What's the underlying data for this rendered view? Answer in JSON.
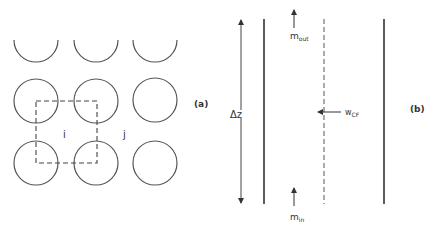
{
  "panel_a": {
    "label": "(a)",
    "cell_labels": {
      "i": "i",
      "j": "j"
    },
    "rod_grid": {
      "rows": 3,
      "cols": 3,
      "top_row_cut": true
    },
    "control_volume": "dashed square"
  },
  "panel_b": {
    "label": "(b)",
    "height_label": "Δz",
    "mass_out": {
      "base": "m",
      "sub": "out"
    },
    "mass_in": {
      "base": "m",
      "sub": "in"
    },
    "crossflow": {
      "base": "w",
      "sub": "CF"
    }
  },
  "colors": {
    "line": "#444444",
    "background": "#ffffff"
  }
}
